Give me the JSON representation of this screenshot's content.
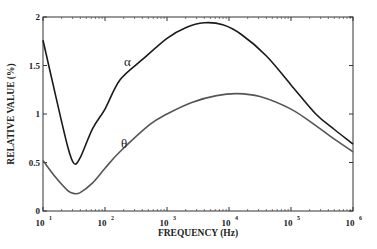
{
  "chart_data": {
    "type": "line",
    "title": "",
    "xlabel": "FREQUENCY (Hz)",
    "ylabel": "RELATIVE VALUE (%)",
    "xscale": "log",
    "xlim": [
      10,
      1000000
    ],
    "ylim": [
      0,
      2
    ],
    "grid": false,
    "legend": "none (inline curve labels)",
    "x_ticks": [
      {
        "base": "10",
        "exp": "1"
      },
      {
        "base": "10",
        "exp": "2"
      },
      {
        "base": "10",
        "exp": "3"
      },
      {
        "base": "10",
        "exp": "4"
      },
      {
        "base": "10",
        "exp": "5"
      },
      {
        "base": "10",
        "exp": "6"
      }
    ],
    "y_ticks": [
      "0",
      "0.5",
      "1",
      "1.5",
      "2"
    ],
    "series": [
      {
        "name": "α",
        "color": "#1a1a1a",
        "log10_x": [
          1.0,
          1.2,
          1.4,
          1.5,
          1.6,
          1.8,
          2.0,
          2.24,
          2.6,
          3.0,
          3.3,
          3.6,
          3.9,
          4.2,
          4.6,
          5.0,
          5.4,
          5.7,
          6.0
        ],
        "values": [
          1.76,
          1.2,
          0.66,
          0.49,
          0.55,
          0.85,
          1.05,
          1.35,
          1.56,
          1.78,
          1.89,
          1.94,
          1.92,
          1.82,
          1.6,
          1.3,
          1.0,
          0.84,
          0.69
        ]
      },
      {
        "name": "θ",
        "color": "#555555",
        "log10_x": [
          1.0,
          1.2,
          1.4,
          1.5,
          1.6,
          1.8,
          2.0,
          2.24,
          2.72,
          3.0,
          3.4,
          3.8,
          4.13,
          4.5,
          5.0,
          5.4,
          5.7,
          6.0
        ],
        "values": [
          0.52,
          0.35,
          0.21,
          0.18,
          0.19,
          0.29,
          0.44,
          0.61,
          0.89,
          1.0,
          1.12,
          1.19,
          1.21,
          1.18,
          1.05,
          0.88,
          0.74,
          0.61
        ]
      }
    ],
    "annotations": [
      {
        "text": "α",
        "near_log10_x": 2.3,
        "near_y": 1.5
      },
      {
        "text": "θ",
        "near_log10_x": 2.25,
        "near_y": 0.7
      }
    ]
  }
}
